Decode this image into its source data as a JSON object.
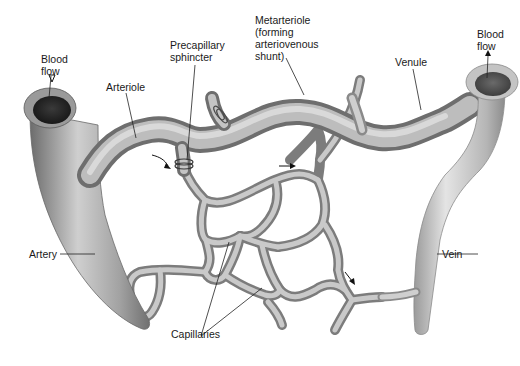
{
  "diagram": {
    "labels": {
      "blood_flow_in_1": "Blood",
      "blood_flow_in_2": "flow",
      "arteriole": "Arteriole",
      "precapillary_1": "Precapillary",
      "precapillary_2": "sphincter",
      "metarteriole_1": "Metarteriole",
      "metarteriole_2": "(forming",
      "metarteriole_3": "arteriovenous",
      "metarteriole_4": "shunt)",
      "venule": "Venule",
      "blood_flow_out_1": "Blood",
      "blood_flow_out_2": "flow",
      "artery": "Artery",
      "vein": "Vein",
      "capillaries": "Capillaries"
    },
    "colors": {
      "vessel_light": "#d8d8d8",
      "vessel_mid": "#a9a9a9",
      "vessel_dark": "#6e6e6e",
      "lumen": "#2a2a2a",
      "text": "#1a1a1a",
      "background": "#ffffff"
    }
  }
}
